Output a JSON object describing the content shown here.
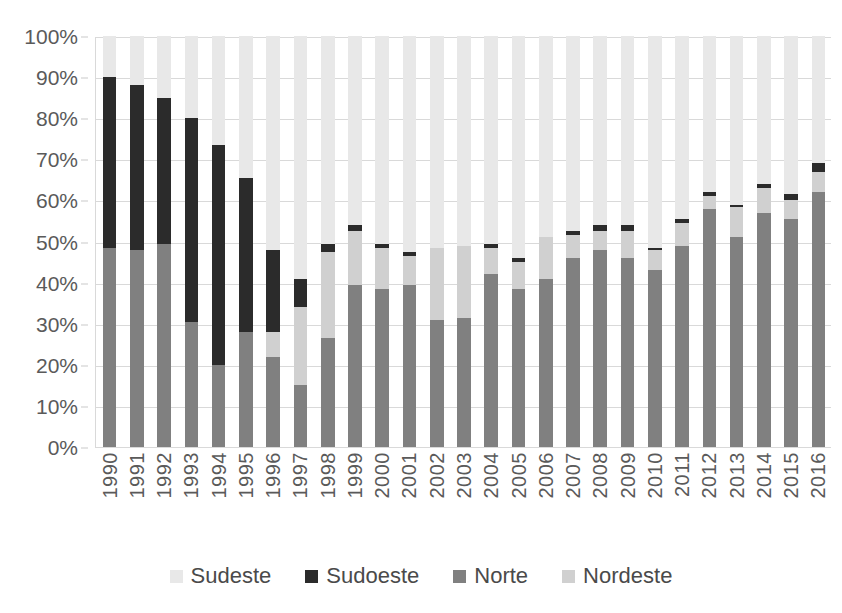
{
  "chart_data": {
    "type": "bar",
    "subtype": "stacked-column-percent",
    "title": "",
    "subtitle": "",
    "xlabel": "",
    "ylabel": "",
    "ylim": [
      0,
      100
    ],
    "y_tick_labels": [
      "0%",
      "10%",
      "20%",
      "30%",
      "40%",
      "50%",
      "60%",
      "70%",
      "80%",
      "90%",
      "100%"
    ],
    "y_tick_values": [
      0,
      10,
      20,
      30,
      40,
      50,
      60,
      70,
      80,
      90,
      100
    ],
    "grid": true,
    "legend_position": "bottom",
    "stack_order_bottom_to_top": [
      "Norte",
      "Nordeste",
      "Sudoeste",
      "Sudeste"
    ],
    "categories": [
      "1990",
      "1991",
      "1992",
      "1993",
      "1994",
      "1995",
      "1996",
      "1997",
      "1998",
      "1999",
      "2000",
      "2001",
      "2002",
      "2003",
      "2004",
      "2005",
      "2006",
      "2007",
      "2008",
      "2009",
      "2010",
      "2011",
      "2012",
      "2013",
      "2014",
      "2015",
      "2016"
    ],
    "series": [
      {
        "name": "Norte",
        "color": "#808080",
        "values": [
          48.5,
          48.0,
          49.5,
          30.5,
          20.0,
          28.0,
          22.0,
          15.0,
          26.5,
          39.5,
          38.5,
          39.5,
          31.0,
          31.5,
          42.0,
          38.5,
          41.0,
          46.0,
          48.0,
          46.0,
          43.0,
          49.0,
          58.0,
          51.0,
          57.0,
          55.5,
          62.0
        ]
      },
      {
        "name": "Nordeste",
        "color": "#d0d0d0",
        "values": [
          0.0,
          0.0,
          0.0,
          0.0,
          0.0,
          0.0,
          6.0,
          19.0,
          21.0,
          13.0,
          10.0,
          7.0,
          17.5,
          17.5,
          6.5,
          6.5,
          10.0,
          5.5,
          4.5,
          6.5,
          5.0,
          5.5,
          3.0,
          7.5,
          6.0,
          4.5,
          5.0
        ]
      },
      {
        "name": "Sudoeste",
        "color": "#2b2b2b",
        "values": [
          41.5,
          40.0,
          35.5,
          49.5,
          53.5,
          37.5,
          20.0,
          7.0,
          2.0,
          1.5,
          1.0,
          1.0,
          0.0,
          0.0,
          1.0,
          1.0,
          0.0,
          1.0,
          1.5,
          1.5,
          0.5,
          1.0,
          1.0,
          0.5,
          1.0,
          1.5,
          2.0
        ]
      },
      {
        "name": "Sudeste",
        "color": "#e8e8e8",
        "values": [
          10.0,
          12.0,
          15.0,
          20.0,
          26.5,
          34.5,
          52.0,
          59.0,
          50.5,
          46.0,
          50.5,
          52.5,
          51.5,
          51.0,
          50.5,
          54.0,
          49.0,
          47.5,
          46.0,
          46.0,
          51.5,
          44.5,
          38.0,
          41.0,
          36.0,
          38.5,
          31.0
        ]
      }
    ]
  },
  "legend": {
    "items": [
      {
        "label": "Sudeste",
        "color": "#e8e8e8"
      },
      {
        "label": "Sudoeste",
        "color": "#2b2b2b"
      },
      {
        "label": "Norte",
        "color": "#808080"
      },
      {
        "label": "Nordeste",
        "color": "#d0d0d0"
      }
    ]
  },
  "colors": {
    "gridline": "#d9d9d9",
    "axis_text": "#5a5a5a",
    "background": "#ffffff"
  }
}
